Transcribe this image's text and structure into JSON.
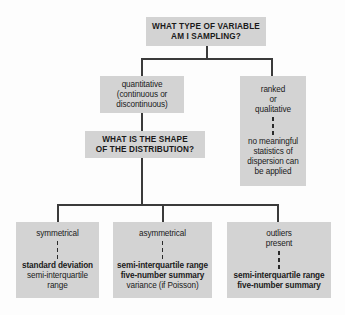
{
  "diagram": {
    "title_node": {
      "line1": "WHAT TYPE OF VARIABLE",
      "line2": "AM I SAMPLING?"
    },
    "quantitative_node": {
      "line1": "quantitative",
      "line2": "(continuous or",
      "line3": "discontinuous)"
    },
    "ranked_node": {
      "line1": "ranked",
      "line2": "or",
      "line3": "qualitative",
      "line4": "no meaningful",
      "line5": "statistics of",
      "line6": "dispersion can",
      "line7": "be applied"
    },
    "shape_node": {
      "line1": "WHAT IS THE SHAPE",
      "line2": "OF THE DISTRIBUTION?"
    },
    "symmetrical_node": {
      "heading": "symmetrical",
      "line1": "standard deviation",
      "line2": "semi-interquartile",
      "line3": "range"
    },
    "asymmetrical_node": {
      "heading": "asymmetrical",
      "line1": "semi-interquartile range",
      "line2": "five-number summary",
      "line3": "variance (if Poisson)"
    },
    "outliers_node": {
      "heading1": "outliers",
      "heading2": "present",
      "line1": "semi-interquartile range",
      "line2": "five-number summary"
    },
    "colors": {
      "node_fill": "#d3d3d3",
      "connector": "#3b3b3b",
      "text": "#1a1a1a",
      "background": "#fdfdfd"
    }
  }
}
